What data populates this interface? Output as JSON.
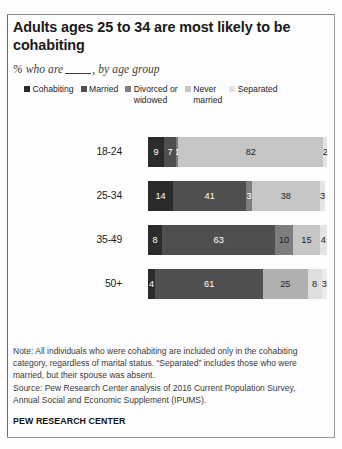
{
  "title": "Adults ages 25 to 34 are most likely to be cohabiting",
  "subtitle_prefix": "% who are",
  "subtitle_suffix": ", by age group",
  "footer": {
    "note": "Note: All individuals who were cohabiting are included only in the cohabiting category, regardless of marital status. “Separated” includes those who were married, but their spouse was absent.",
    "source": "Source: Pew Research Center analysis of 2016 Current Population Survey, Annual Social and Economic Supplement (IPUMS).",
    "organization": "PEW RESEARCH CENTER"
  },
  "chart_data": {
    "type": "bar",
    "subtype": "stacked-horizontal-100",
    "title": "Adults ages 25 to 34 are most likely to be cohabiting",
    "subtitle": "% who are ____, by age group",
    "xlabel": "",
    "ylabel": "",
    "xlim": [
      0,
      100
    ],
    "grid": false,
    "legend_position": "top",
    "categories": [
      "18-24",
      "25-34",
      "35-49",
      "50+"
    ],
    "series": [
      {
        "name": "Cohabiting",
        "color": "#2b2b2b",
        "label_color": "#ffffff",
        "values": [
          9,
          14,
          8,
          4
        ]
      },
      {
        "name": "Married",
        "color": "#4f4f4f",
        "label_color": "#ffffff",
        "values": [
          7,
          41,
          63,
          61
        ]
      },
      {
        "name": "Divorced or widowed",
        "color": "#7d7d7d",
        "label_color": "#ffffff",
        "values": [
          1,
          3,
          10,
          25
        ]
      },
      {
        "name": "Never married",
        "color": "#c6c6c6",
        "label_color": "#1c1c1c",
        "values": [
          82,
          38,
          15,
          8
        ]
      },
      {
        "name": "Separated",
        "color": "#e4e4e4",
        "label_color": "#1c1c1c",
        "values": [
          2,
          3,
          4,
          3
        ]
      }
    ],
    "legend": [
      {
        "label": "Cohabiting",
        "color": "#2b2b2b"
      },
      {
        "label": "Married",
        "color": "#4f4f4f"
      },
      {
        "label": "Divorced or\nwidowed",
        "color": "#7d7d7d"
      },
      {
        "label": "Never\nmarried",
        "color": "#c6c6c6"
      },
      {
        "label": "Separated",
        "color": "#e4e4e4"
      }
    ],
    "rows": [
      {
        "category": "18-24",
        "segments": [
          {
            "series": "Cohabiting",
            "value": 9,
            "label": "9",
            "color": "#2b2b2b",
            "label_color": "#ffffff"
          },
          {
            "series": "Married",
            "value": 7,
            "label": "7",
            "color": "#4f4f4f",
            "label_color": "#ffffff"
          },
          {
            "series": "Divorced or widowed",
            "value": 1,
            "label": "1",
            "color": "#7d7d7d",
            "label_color": "#ffffff"
          },
          {
            "series": "Never married",
            "value": 82,
            "label": "82",
            "color": "#c6c6c6",
            "label_color": "#1c1c1c"
          },
          {
            "series": "Separated",
            "value": 2,
            "label": "2",
            "color": "#e4e4e4",
            "label_color": "#1c1c1c"
          }
        ]
      },
      {
        "category": "25-34",
        "segments": [
          {
            "series": "Cohabiting",
            "value": 14,
            "label": "14",
            "color": "#2b2b2b",
            "label_color": "#ffffff"
          },
          {
            "series": "Married",
            "value": 41,
            "label": "41",
            "color": "#4f4f4f",
            "label_color": "#ffffff"
          },
          {
            "series": "Divorced or widowed",
            "value": 3,
            "label": "3",
            "color": "#7d7d7d",
            "label_color": "#ffffff"
          },
          {
            "series": "Never married",
            "value": 38,
            "label": "38",
            "color": "#c6c6c6",
            "label_color": "#1c1c1c"
          },
          {
            "series": "Separated",
            "value": 3,
            "label": "3",
            "color": "#e4e4e4",
            "label_color": "#1c1c1c"
          }
        ]
      },
      {
        "category": "35-49",
        "segments": [
          {
            "series": "Cohabiting",
            "value": 8,
            "label": "8",
            "color": "#2b2b2b",
            "label_color": "#ffffff"
          },
          {
            "series": "Married",
            "value": 63,
            "label": "63",
            "color": "#4f4f4f",
            "label_color": "#ffffff"
          },
          {
            "series": "Divorced or widowed",
            "value": 10,
            "label": "10",
            "color": "#7d7d7d",
            "label_color": "#1c1c1c"
          },
          {
            "series": "Never married",
            "value": 15,
            "label": "15",
            "color": "#c6c6c6",
            "label_color": "#1c1c1c"
          },
          {
            "series": "Separated",
            "value": 4,
            "label": "4",
            "color": "#e4e4e4",
            "label_color": "#1c1c1c"
          }
        ]
      },
      {
        "category": "50+",
        "segments": [
          {
            "series": "Cohabiting",
            "value": 4,
            "label": "4",
            "color": "#2b2b2b",
            "label_color": "#ffffff"
          },
          {
            "series": "Married",
            "value": 61,
            "label": "61",
            "color": "#4f4f4f",
            "label_color": "#ffffff"
          },
          {
            "series": "Divorced or widowed",
            "value": 25,
            "label": "25",
            "color": "#b0b0b0",
            "label_color": "#1c1c1c"
          },
          {
            "series": "Never married",
            "value": 8,
            "label": "8",
            "color": "#dedede",
            "label_color": "#1c1c1c"
          },
          {
            "series": "Separated",
            "value": 3,
            "label": "3",
            "color": "#ececec",
            "label_color": "#1c1c1c"
          }
        ]
      }
    ]
  }
}
